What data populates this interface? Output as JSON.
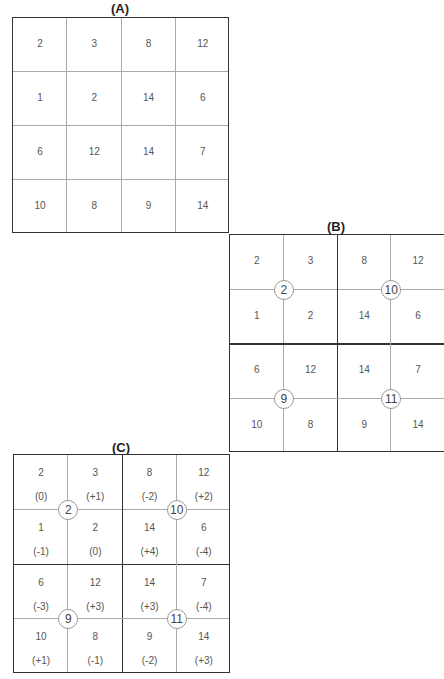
{
  "panels": {
    "A": {
      "title": "(A)",
      "cells": [
        [
          "2",
          "3",
          "8",
          "12"
        ],
        [
          "1",
          "2",
          "14",
          "6"
        ],
        [
          "6",
          "12",
          "14",
          "7"
        ],
        [
          "10",
          "8",
          "9",
          "14"
        ]
      ]
    },
    "B": {
      "title": "(B)",
      "cells": [
        [
          "2",
          "3",
          "8",
          "12"
        ],
        [
          "1",
          "2",
          "14",
          "6"
        ],
        [
          "6",
          "12",
          "14",
          "7"
        ],
        [
          "10",
          "8",
          "9",
          "14"
        ]
      ],
      "pooled": [
        "2",
        "10",
        "9",
        "11"
      ]
    },
    "C": {
      "title": "(C)",
      "cells": [
        [
          "2",
          "3",
          "8",
          "12"
        ],
        [
          "1",
          "2",
          "14",
          "6"
        ],
        [
          "6",
          "12",
          "14",
          "7"
        ],
        [
          "10",
          "8",
          "9",
          "14"
        ]
      ],
      "offsets": [
        [
          "(0)",
          "(+1)",
          "(-2)",
          "(+2)"
        ],
        [
          "(-1)",
          "(0)",
          "(+4)",
          "(-4)"
        ],
        [
          "(-3)",
          "(+3)",
          "(+3)",
          "(-4)"
        ],
        [
          "(+1)",
          "(-1)",
          "(-2)",
          "(+3)"
        ]
      ],
      "pooled": [
        "2",
        "10",
        "9",
        "11"
      ]
    }
  }
}
